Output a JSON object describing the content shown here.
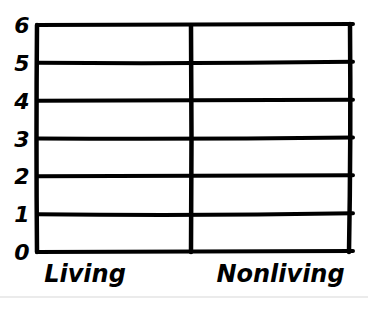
{
  "chart_data": {
    "type": "bar",
    "title": "",
    "xlabel": "",
    "ylabel": "",
    "categories": [
      "Living",
      "Nonliving"
    ],
    "values": [
      null,
      null
    ],
    "ylim": [
      0,
      6
    ],
    "yticks": [
      "0",
      "1",
      "2",
      "3",
      "4",
      "5",
      "6"
    ],
    "grid": true,
    "legend": "none",
    "style": "hand-drawn blank template"
  }
}
